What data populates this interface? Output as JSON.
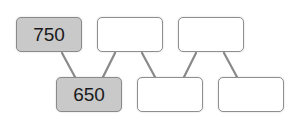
{
  "diagram": {
    "type": "number-pyramid",
    "colors": {
      "filled_box": "#c9c9c9",
      "empty_box": "#ffffff",
      "border": "#8f8f8f",
      "connector": "#8a8a8a"
    },
    "top_row": [
      {
        "value": "750",
        "filled": true
      },
      {
        "value": "",
        "filled": false
      },
      {
        "value": "",
        "filled": false
      }
    ],
    "bottom_row": [
      {
        "value": "650",
        "filled": true
      },
      {
        "value": "",
        "filled": false
      },
      {
        "value": "",
        "filled": false
      }
    ]
  }
}
